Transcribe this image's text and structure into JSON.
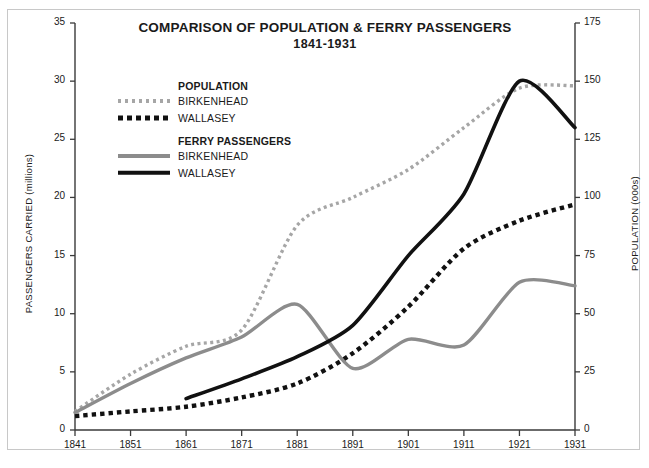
{
  "chart_data": {
    "type": "line",
    "title": "COMPARISON OF POPULATION & FERRY PASSENGERS",
    "subtitle": "1841-1931",
    "xlabel": "",
    "ylabel": "PASSENGERS CARRIED (millions)",
    "y2label": "POPULATION (000s)",
    "grid": false,
    "legend_position": "upper-left-inside",
    "x": [
      1841,
      1851,
      1861,
      1871,
      1881,
      1891,
      1901,
      1911,
      1921,
      1931
    ],
    "xticklabels": [
      "1841",
      "1851",
      "1861",
      "1871",
      "1881",
      "1891",
      "1901",
      "1911",
      "1921",
      "1931"
    ],
    "xlim": [
      1841,
      1931
    ],
    "ylim": [
      0,
      35
    ],
    "yticks": [
      0,
      5,
      10,
      15,
      20,
      25,
      30,
      35
    ],
    "yticklabels": [
      "0",
      "5",
      "10",
      "15",
      "20",
      "25",
      "30",
      "35"
    ],
    "y2lim": [
      0,
      175
    ],
    "y2ticks": [
      0,
      25,
      50,
      75,
      100,
      125,
      150,
      175
    ],
    "y2ticklabels": [
      "0",
      "25",
      "50",
      "75",
      "100",
      "125",
      "150",
      "175"
    ],
    "series": [
      {
        "name": "POPULATION BIRKENHEAD",
        "group": "POPULATION",
        "place": "BIRKENHEAD",
        "axis": "right",
        "style": "dotted",
        "color": "#a6a6a6",
        "x": [
          1841,
          1851,
          1861,
          1871,
          1881,
          1891,
          1901,
          1911,
          1921,
          1931
        ],
        "values": [
          8,
          24,
          36,
          43,
          88,
          100,
          112,
          130,
          147,
          148
        ],
        "units": "thousands"
      },
      {
        "name": "POPULATION WALLASEY",
        "group": "POPULATION",
        "place": "WALLASEY",
        "axis": "right",
        "style": "dotted",
        "color": "#111111",
        "x": [
          1841,
          1851,
          1861,
          1871,
          1881,
          1891,
          1901,
          1911,
          1921,
          1931
        ],
        "values": [
          6,
          8,
          10,
          14,
          20,
          33,
          53,
          78,
          90,
          97
        ],
        "units": "thousands"
      },
      {
        "name": "FERRY PASSENGERS BIRKENHEAD",
        "group": "FERRY PASSENGERS",
        "place": "BIRKENHEAD",
        "axis": "left",
        "style": "solid",
        "color": "#8c8c8c",
        "x": [
          1841,
          1851,
          1861,
          1871,
          1881,
          1891,
          1901,
          1911,
          1921,
          1931
        ],
        "values": [
          1.5,
          4.0,
          6.2,
          8.0,
          10.8,
          5.3,
          7.8,
          7.3,
          12.7,
          12.4
        ],
        "units": "millions"
      },
      {
        "name": "FERRY PASSENGERS WALLASEY",
        "group": "FERRY PASSENGERS",
        "place": "WALLASEY",
        "axis": "left",
        "style": "solid",
        "color": "#111111",
        "x": [
          1861,
          1871,
          1881,
          1891,
          1901,
          1911,
          1921,
          1931
        ],
        "values": [
          2.7,
          4.4,
          6.3,
          9.0,
          15.0,
          20.3,
          30.0,
          26.0
        ],
        "units": "millions"
      }
    ]
  },
  "legend": {
    "groups": [
      {
        "heading": "POPULATION",
        "entries": [
          {
            "label": "BIRKENHEAD",
            "key": "dot-gray"
          },
          {
            "label": "WALLASEY",
            "key": "dot-black"
          }
        ]
      },
      {
        "heading": "FERRY PASSENGERS",
        "entries": [
          {
            "label": "BIRKENHEAD",
            "key": "solid-gray"
          },
          {
            "label": "WALLASEY",
            "key": "solid-black"
          }
        ]
      }
    ]
  },
  "colors": {
    "axis": "#3a3a3a",
    "frame": "#c8c8c8",
    "text": "#1a1a1a",
    "gray_series": "#8c8c8c",
    "gray_dotted": "#a6a6a6",
    "black_series": "#111111",
    "background": "#ffffff"
  }
}
